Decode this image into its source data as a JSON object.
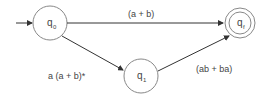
{
  "diagram": {
    "type": "finite-automaton",
    "states": [
      {
        "id": "q0",
        "label": "q",
        "sub": "0",
        "initial": true,
        "final": false
      },
      {
        "id": "q1",
        "label": "q",
        "sub": "1",
        "initial": false,
        "final": false
      },
      {
        "id": "qf",
        "label": "q",
        "sub": "f",
        "initial": false,
        "final": true
      }
    ],
    "edges": [
      {
        "from": "q0",
        "to": "qf",
        "label": "(a + b)"
      },
      {
        "from": "q0",
        "to": "q1",
        "label": "a (a + b)*"
      },
      {
        "from": "q1",
        "to": "qf",
        "label": "(ab + ba)"
      }
    ]
  }
}
